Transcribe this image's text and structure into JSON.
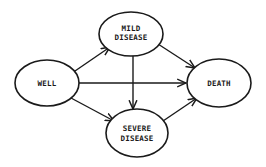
{
  "diagram": {
    "type": "state-transition",
    "nodes": [
      {
        "id": "well",
        "label_lines": [
          "WELL"
        ],
        "cx": 47,
        "cy": 83,
        "rx": 32,
        "ry": 23
      },
      {
        "id": "mild",
        "label_lines": [
          "MILD",
          "DISEASE"
        ],
        "cx": 131,
        "cy": 34,
        "rx": 32,
        "ry": 22
      },
      {
        "id": "death",
        "label_lines": [
          "DEATH"
        ],
        "cx": 219,
        "cy": 83,
        "rx": 32,
        "ry": 24
      },
      {
        "id": "severe",
        "label_lines": [
          "SEVERE",
          "DISEASE"
        ],
        "cx": 137,
        "cy": 133,
        "rx": 31,
        "ry": 24
      }
    ],
    "edges": [
      {
        "from": "well",
        "to": "mild"
      },
      {
        "from": "well",
        "to": "death"
      },
      {
        "from": "well",
        "to": "severe"
      },
      {
        "from": "mild",
        "to": "death"
      },
      {
        "from": "mild",
        "to": "severe"
      },
      {
        "from": "severe",
        "to": "death"
      }
    ],
    "colors": {
      "stroke": "#1a1a1a",
      "background": "#ffffff"
    }
  },
  "labels": {
    "well": "WELL",
    "mild_1": "MILD",
    "mild_2": "DISEASE",
    "death": "DEATH",
    "severe_1": "SEVERE",
    "severe_2": "DISEASE"
  }
}
